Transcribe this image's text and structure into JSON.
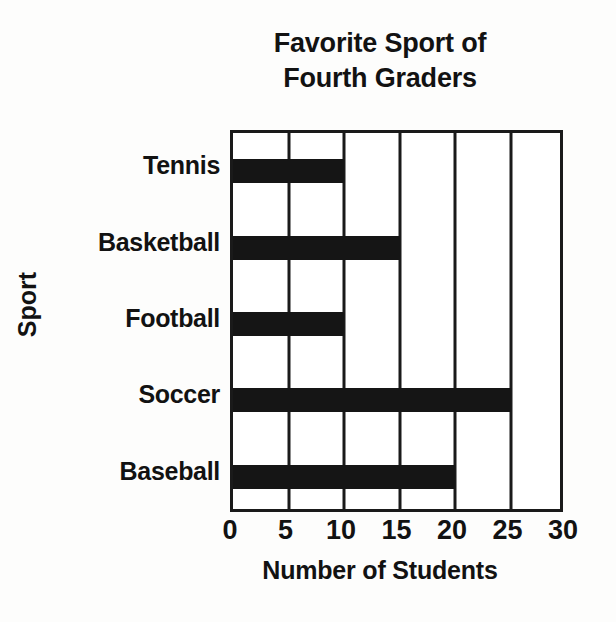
{
  "chart_data": {
    "type": "bar",
    "orientation": "horizontal",
    "title": "Favorite Sport of Fourth Graders",
    "title_lines": [
      "Favorite Sport of",
      "Fourth Graders"
    ],
    "xlabel": "Number of Students",
    "ylabel": "Sport",
    "categories": [
      "Baseball",
      "Soccer",
      "Football",
      "Basketball",
      "Tennis"
    ],
    "values": [
      20,
      25,
      10,
      15,
      10
    ],
    "xticks": [
      0,
      5,
      10,
      15,
      20,
      25,
      30
    ],
    "xticklabels": [
      "0",
      "5",
      "10",
      "15",
      "20",
      "25",
      "30"
    ],
    "xlim": [
      0,
      30
    ],
    "grid": "vertical",
    "legend": null,
    "bar_color": "#151515",
    "axis_color": "#1a1a1a",
    "background_color": "#ffffff"
  }
}
